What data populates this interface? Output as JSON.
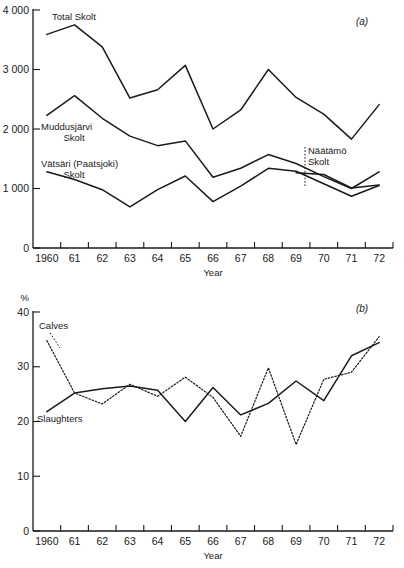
{
  "figure": {
    "width": 404,
    "height": 568,
    "background": "#ffffff",
    "ink_color": "#1a1a1a"
  },
  "panels": [
    {
      "id": "panel-a",
      "panel_label": "(a)",
      "y_unit_label": "",
      "x_axis_title": "Year",
      "y_ticks": [
        "4 000",
        "3 000",
        "2 000",
        "1 000",
        "0"
      ],
      "x_ticks": [
        "1960",
        "61",
        "62",
        "63",
        "64",
        "65",
        "66",
        "67",
        "68",
        "69",
        "70",
        "71",
        "72"
      ],
      "series_labels": [
        {
          "name": "total-skolt-label",
          "lines": [
            "Total Skolt"
          ]
        },
        {
          "name": "muddusjarvi-skolt-label",
          "lines": [
            "Muddusjärvi",
            "Skolt"
          ]
        },
        {
          "name": "vatsari-paatsjoki-skolt-label",
          "lines": [
            "Vätsäri (Paatsjoki)",
            "Skolt"
          ]
        },
        {
          "name": "naatamo-skolt-label",
          "lines": [
            "Näätämö",
            "Skolt"
          ]
        }
      ]
    },
    {
      "id": "panel-b",
      "panel_label": "(b)",
      "y_unit_label": "%",
      "x_axis_title": "Year",
      "y_ticks": [
        "40",
        "30",
        "20",
        "10",
        "0"
      ],
      "x_ticks": [
        "1960",
        "61",
        "62",
        "63",
        "64",
        "65",
        "66",
        "67",
        "68",
        "69",
        "70",
        "71",
        "72"
      ],
      "series_labels": [
        {
          "name": "calves-label",
          "lines": [
            "Calves"
          ]
        },
        {
          "name": "slaughters-label",
          "lines": [
            "Slaughters"
          ]
        }
      ]
    }
  ],
  "chart_data": [
    {
      "type": "line",
      "id": "panel-a",
      "title": "(a)",
      "xlabel": "Year",
      "ylabel": "",
      "xlim": [
        1959,
        1972
      ],
      "ylim": [
        0,
        4000
      ],
      "ytick_values": [
        0,
        1000,
        2000,
        3000,
        4000
      ],
      "ytick_labels": [
        "0",
        "1 000",
        "2 000",
        "3 000",
        "4 000"
      ],
      "xtick_values": [
        1959,
        1960,
        1961,
        1962,
        1963,
        1964,
        1965,
        1966,
        1967,
        1968,
        1969,
        1970,
        1971,
        1972
      ],
      "xtick_labels": [
        "1960",
        "61",
        "62",
        "63",
        "64",
        "65",
        "66",
        "67",
        "68",
        "69",
        "70",
        "71",
        "72"
      ],
      "xtick_label_placement": "between-ticks",
      "grid": false,
      "legend": "inline-annotations",
      "x": [
        1959.5,
        1960.5,
        1961.5,
        1962.5,
        1963.5,
        1964.5,
        1965.5,
        1966.5,
        1967.5,
        1968.5,
        1969.5,
        1970.5,
        1971.5
      ],
      "series": [
        {
          "name": "Total Skolt",
          "style": "solid",
          "values": [
            3590,
            3750,
            3380,
            2520,
            2660,
            3070,
            2000,
            2320,
            3000,
            2530,
            2250,
            1830,
            2410
          ]
        },
        {
          "name": "Muddusjärvi Skolt",
          "style": "solid",
          "values": [
            2230,
            2560,
            2180,
            1880,
            1720,
            1800,
            1190,
            1340,
            1570,
            1420,
            1200,
            1000,
            1280
          ]
        },
        {
          "name": "Vätsäri (Paatsjoki) Skolt",
          "style": "solid",
          "values": [
            1280,
            1150,
            980,
            690,
            980,
            1210,
            780,
            1040,
            1340,
            1290,
            1080,
            870,
            1050
          ]
        },
        {
          "name": "Näätämö Skolt",
          "style": "solid",
          "annotation_year": 1969,
          "values": [
            null,
            null,
            null,
            null,
            null,
            null,
            null,
            null,
            null,
            1265,
            1235,
            1010,
            1060
          ]
        }
      ]
    },
    {
      "type": "line",
      "id": "panel-b",
      "title": "(b)",
      "xlabel": "Year",
      "ylabel": "%",
      "xlim": [
        1959,
        1972
      ],
      "ylim": [
        0,
        40
      ],
      "ytick_values": [
        0,
        10,
        20,
        30,
        40
      ],
      "ytick_labels": [
        "0",
        "10",
        "20",
        "30",
        "40"
      ],
      "xtick_values": [
        1959,
        1960,
        1961,
        1962,
        1963,
        1964,
        1965,
        1966,
        1967,
        1968,
        1969,
        1970,
        1971,
        1972
      ],
      "xtick_labels": [
        "1960",
        "61",
        "62",
        "63",
        "64",
        "65",
        "66",
        "67",
        "68",
        "69",
        "70",
        "71",
        "72"
      ],
      "xtick_label_placement": "between-ticks",
      "grid": false,
      "legend": "inline-annotations",
      "x": [
        1959.5,
        1960.5,
        1961.5,
        1962.5,
        1963.5,
        1964.5,
        1965.5,
        1966.5,
        1967.5,
        1968.5,
        1969.5,
        1970.5,
        1971.5
      ],
      "series": [
        {
          "name": "Calves",
          "style": "dotted",
          "values": [
            34.8,
            25.2,
            23.2,
            26.8,
            24.6,
            28.1,
            24.4,
            17.3,
            29.8,
            15.8,
            27.7,
            29.0,
            35.5
          ]
        },
        {
          "name": "Slaughters",
          "style": "solid",
          "values": [
            21.8,
            25.2,
            26.0,
            26.5,
            25.7,
            20.0,
            26.2,
            21.2,
            23.3,
            27.4,
            23.8,
            32.0,
            34.4
          ]
        }
      ]
    }
  ]
}
